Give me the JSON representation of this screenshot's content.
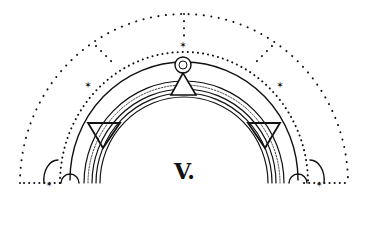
{
  "diagram": {
    "label": "V.",
    "stroke_color": "#111111",
    "background": "#ffffff",
    "elements": {
      "outer_dotted_arc": "dotted semicircle",
      "inner_dotted_arc": "dotted semicircle",
      "outer_solid_arc": "solid semicircle",
      "inner_ring_band": "multi-line concentric band",
      "top_circle_marker": "double circle",
      "top_triangle": "upward triangle",
      "side_triangles": "downward triangles",
      "star_markers": "small six-point stars",
      "end_semicircles": "small half-circles at base"
    }
  }
}
